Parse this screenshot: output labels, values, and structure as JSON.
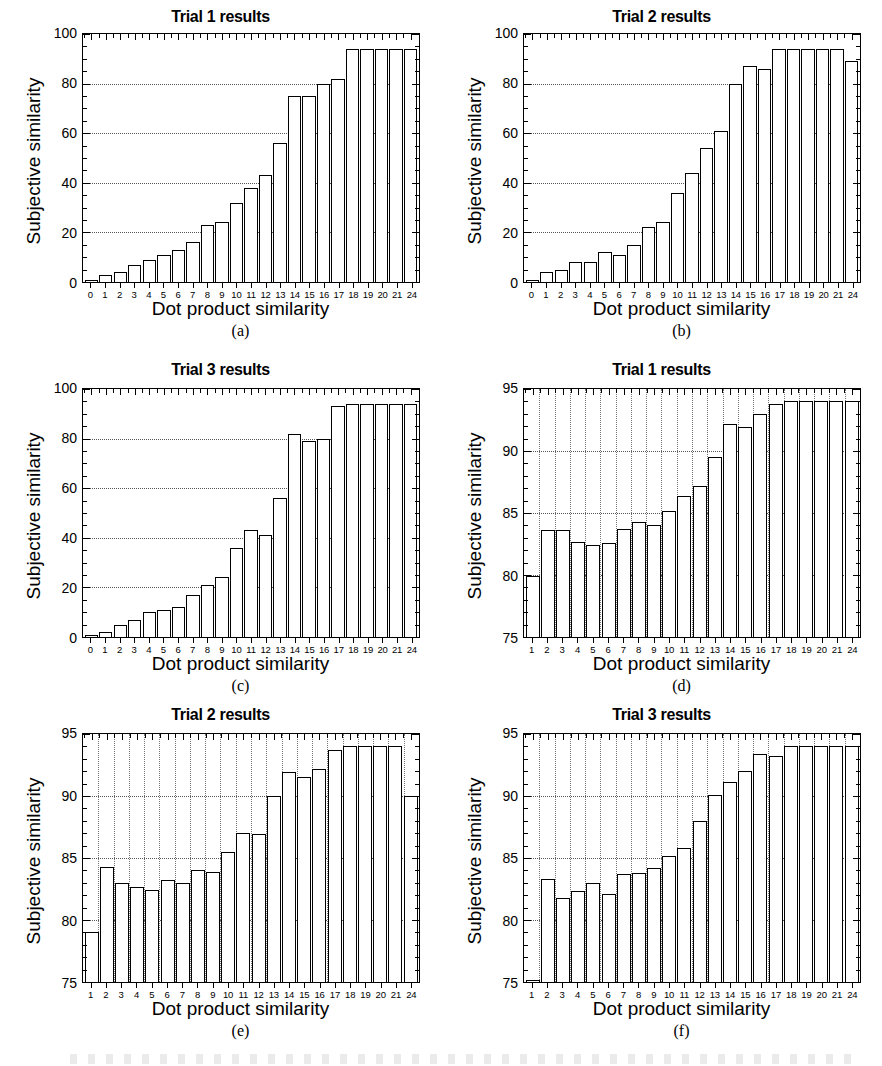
{
  "figure": {
    "width": 882,
    "height": 1066,
    "background": "#ffffff",
    "ink": "#000000"
  },
  "axis_text": {
    "xlabel": "Dot product similarity",
    "ylabel": "Subjective similarity"
  },
  "chart_data": [
    {
      "panel": "a",
      "caption": "(a)",
      "type": "bar",
      "title": "Trial 1 results",
      "xlabel": "Dot product similarity",
      "ylabel": "Subjective similarity",
      "ylim": [
        0,
        100
      ],
      "yticks": [
        0,
        20,
        40,
        60,
        80,
        100
      ],
      "xlim_categories": [
        "0",
        "1",
        "2",
        "3",
        "4",
        "5",
        "6",
        "7",
        "8",
        "9",
        "10",
        "11",
        "12",
        "13",
        "14",
        "15",
        "16",
        "17",
        "18",
        "19",
        "20",
        "21",
        "24"
      ],
      "categories": [
        "0",
        "1",
        "2",
        "3",
        "4",
        "5",
        "6",
        "7",
        "8",
        "9",
        "10",
        "11",
        "12",
        "13",
        "14",
        "15",
        "16",
        "17",
        "18",
        "19",
        "20",
        "21",
        "24"
      ],
      "values": [
        1,
        3,
        4,
        7,
        9,
        11,
        13,
        16,
        23,
        24,
        32,
        38,
        43,
        56,
        75,
        75,
        80,
        82,
        94,
        94,
        94,
        94,
        94
      ],
      "grid": "horizontal-dotted",
      "legend": "none"
    },
    {
      "panel": "b",
      "caption": "(b)",
      "type": "bar",
      "title": "Trial 2 results",
      "xlabel": "Dot product similarity",
      "ylabel": "Subjective similarity",
      "ylim": [
        0,
        100
      ],
      "yticks": [
        0,
        20,
        40,
        60,
        80,
        100
      ],
      "categories": [
        "0",
        "1",
        "2",
        "3",
        "4",
        "5",
        "6",
        "7",
        "8",
        "9",
        "10",
        "11",
        "12",
        "13",
        "14",
        "15",
        "16",
        "17",
        "18",
        "19",
        "20",
        "21",
        "24"
      ],
      "values": [
        1,
        4,
        5,
        8,
        8,
        12,
        11,
        15,
        22,
        24,
        36,
        44,
        54,
        61,
        80,
        87,
        86,
        94,
        94,
        94,
        94,
        94,
        89
      ],
      "grid": "horizontal-dotted",
      "legend": "none"
    },
    {
      "panel": "c",
      "caption": "(c)",
      "type": "bar",
      "title": "Trial 3 results",
      "xlabel": "Dot product similarity",
      "ylabel": "Subjective similarity",
      "ylim": [
        0,
        100
      ],
      "yticks": [
        0,
        20,
        40,
        60,
        80,
        100
      ],
      "categories": [
        "0",
        "1",
        "2",
        "3",
        "4",
        "5",
        "6",
        "7",
        "8",
        "9",
        "10",
        "11",
        "12",
        "13",
        "14",
        "15",
        "16",
        "17",
        "18",
        "19",
        "20",
        "21",
        "24"
      ],
      "values": [
        1,
        2,
        5,
        7,
        10,
        11,
        12,
        17,
        21,
        24,
        36,
        43,
        41,
        56,
        82,
        79,
        80,
        93,
        94,
        94,
        94,
        94,
        94
      ],
      "grid": "horizontal-dotted",
      "legend": "none"
    },
    {
      "panel": "d",
      "caption": "(d)",
      "type": "bar",
      "title": "Trial 1 results",
      "xlabel": "Dot product similarity",
      "ylabel": "Subjective similarity",
      "ylim": [
        75,
        95
      ],
      "yticks": [
        75,
        80,
        85,
        90,
        95
      ],
      "categories": [
        "1",
        "2",
        "3",
        "4",
        "5",
        "6",
        "7",
        "8",
        "9",
        "10",
        "11",
        "12",
        "13",
        "14",
        "15",
        "16",
        "17",
        "18",
        "19",
        "20",
        "21",
        "24"
      ],
      "values": [
        79.9,
        83.6,
        83.6,
        82.7,
        82.4,
        82.6,
        83.7,
        84.3,
        84.0,
        85.2,
        86.4,
        87.2,
        89.5,
        92.2,
        91.9,
        93.0,
        93.8,
        94.0,
        94.0,
        94.0,
        94.0,
        94.0
      ],
      "grid": "both-dotted",
      "legend": "none"
    },
    {
      "panel": "e",
      "caption": "(e)",
      "type": "bar",
      "title": "Trial 2 results",
      "xlabel": "Dot product similarity",
      "ylabel": "Subjective similarity",
      "ylim": [
        75,
        95
      ],
      "yticks": [
        75,
        80,
        85,
        90,
        95
      ],
      "categories": [
        "1",
        "2",
        "3",
        "4",
        "5",
        "6",
        "7",
        "8",
        "9",
        "10",
        "11",
        "12",
        "13",
        "14",
        "15",
        "16",
        "17",
        "18",
        "19",
        "20",
        "21",
        "24"
      ],
      "values": [
        79.0,
        84.3,
        83.0,
        82.7,
        82.4,
        83.2,
        83.0,
        84.0,
        83.9,
        85.5,
        87.0,
        86.9,
        90.0,
        91.9,
        91.5,
        92.2,
        93.7,
        94.0,
        94.0,
        94.0,
        94.0,
        90.0
      ],
      "grid": "both-dotted",
      "legend": "none"
    },
    {
      "panel": "f",
      "caption": "(f)",
      "type": "bar",
      "title": "Trial 3 results",
      "xlabel": "Dot product similarity",
      "ylabel": "Subjective similarity",
      "ylim": [
        75,
        95
      ],
      "yticks": [
        75,
        80,
        85,
        90,
        95
      ],
      "categories": [
        "1",
        "2",
        "3",
        "4",
        "5",
        "6",
        "7",
        "8",
        "9",
        "10",
        "11",
        "12",
        "13",
        "14",
        "15",
        "16",
        "17",
        "18",
        "19",
        "20",
        "21",
        "24"
      ],
      "values": [
        75.2,
        83.3,
        81.8,
        82.3,
        83.0,
        82.1,
        83.7,
        83.8,
        84.2,
        85.2,
        85.8,
        88.0,
        90.1,
        91.1,
        92.0,
        93.4,
        93.2,
        94.0,
        94.0,
        94.0,
        94.0,
        94.0
      ],
      "grid": "both-dotted",
      "legend": "none"
    }
  ]
}
